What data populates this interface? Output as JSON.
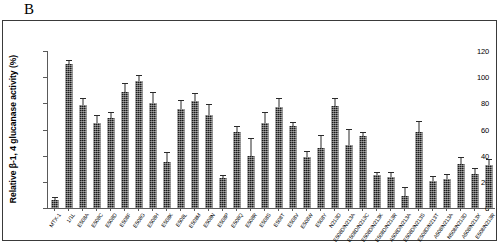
{
  "panel": {
    "label": "B"
  },
  "chart_data": {
    "type": "bar",
    "title": "",
    "xlabel": "",
    "ylabel": "Relative β-1, 4 glucanase activity (%)",
    "ylim": [
      0,
      120
    ],
    "yticks": [
      0,
      20,
      40,
      60,
      80,
      100,
      120
    ],
    "ytick_labels": [
      "0",
      "20",
      "40",
      "60",
      "80",
      "100",
      "120"
    ],
    "grid": false,
    "legend": "none",
    "error_bars": "standard deviation",
    "categories": [
      "MTX-1",
      "1/1L",
      "E508A",
      "E508C",
      "E508D",
      "E508F",
      "E508G",
      "E508H",
      "E508K",
      "E508L",
      "E508M",
      "E508N",
      "E508P",
      "E508Q",
      "E508R",
      "E508S",
      "E508T",
      "E508V",
      "E508W",
      "E508Y",
      "N213D",
      "E508D/N213A",
      "E508D/N213C",
      "E508D/N213K",
      "E508D/N213R",
      "A508D/N213A",
      "E508D/N213S",
      "E508D/N213T",
      "A508/N213A",
      "N508/N213D",
      "A508/N213X",
      "E508/N213R"
    ],
    "values": [
      6,
      110,
      79,
      65,
      69,
      89,
      97,
      80,
      35,
      76,
      82,
      71,
      23,
      58,
      40,
      65,
      77,
      63,
      39,
      46,
      78,
      48,
      55,
      25,
      24,
      9,
      58,
      21,
      22,
      34,
      26,
      33
    ],
    "errors": [
      1.5,
      2,
      4,
      5,
      4,
      6,
      4,
      8,
      7,
      6,
      5,
      8,
      1.5,
      4,
      13,
      8,
      6,
      2,
      4,
      9,
      5,
      12,
      2,
      2,
      3,
      6,
      8,
      3,
      3,
      4,
      4,
      4
    ]
  }
}
